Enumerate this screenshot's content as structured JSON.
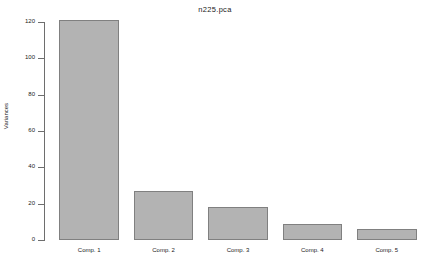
{
  "chart_data": {
    "type": "bar",
    "title": "n225.pca",
    "xlabel": "",
    "ylabel": "Variances",
    "categories": [
      "Comp. 1",
      "Comp. 2",
      "Comp. 3",
      "Comp. 4",
      "Comp. 5"
    ],
    "values": [
      121,
      27,
      18,
      9,
      6
    ],
    "ylim": [
      0,
      120
    ],
    "yticks": [
      0,
      20,
      40,
      60,
      80,
      100,
      120
    ],
    "ytick_labels": [
      "0",
      "20",
      "40",
      "60",
      "80",
      "100",
      "120"
    ],
    "grid": false,
    "legend": null,
    "bar_fill_color": "#b3b3b3",
    "bar_border_color": "#808080",
    "axis_color": "#6e6e6e",
    "background_color": "#ffffff"
  }
}
